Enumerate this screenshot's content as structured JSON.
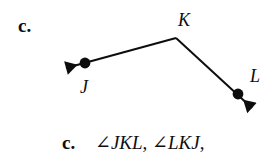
{
  "page": {
    "background_color": "#ffffff",
    "ink_color": "#0d0d0d"
  },
  "problem": {
    "letter": "c."
  },
  "figure": {
    "type": "angle-diagram",
    "vertex_label": "K",
    "ray1_point_label": "J",
    "ray2_point_label": "L",
    "points": {
      "K": {
        "x": 176,
        "y": 38
      },
      "J": {
        "x": 85,
        "y": 63
      },
      "L": {
        "x": 238,
        "y": 94
      }
    },
    "arrow_tips": {
      "J": {
        "x": 57,
        "y": 71
      },
      "L": {
        "x": 260,
        "y": 114
      }
    },
    "dot_radius": 5,
    "stroke_width": 2
  },
  "answer": {
    "letter": "c.",
    "angle_symbol": "∠",
    "name1": "JKL",
    "name2": "LKJ",
    "separator": ", ",
    "terminator": ",",
    "full_text": "∠JKL, ∠LKJ,"
  }
}
